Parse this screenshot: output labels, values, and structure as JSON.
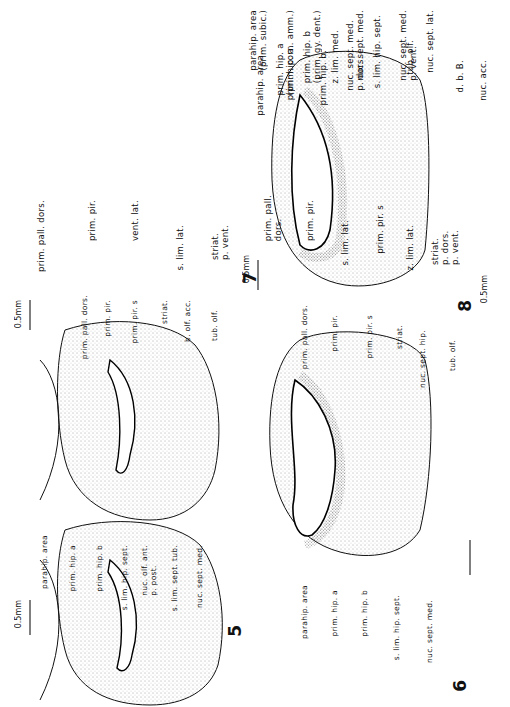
{
  "figure": {
    "panels": [
      {
        "id": "7",
        "number": "7",
        "scale": "0.5mm",
        "labels": [
          "parahip. area\n(prim. subic.)",
          "prim. hip. a\n(prim. corn. amm.)",
          "prim. hip. b\n(prim. gy. dent.)",
          "z. lim. med.",
          "nuc. sept. med.",
          "tub. olf.",
          "prim. pall. dors.",
          "prim. pir.",
          "vent. lat.",
          "s. lim. lat.",
          "striat.\np. vent."
        ]
      },
      {
        "id": "8",
        "number": "8",
        "scale": "0.5mm",
        "labels": [
          "parahip. area",
          "prim. hip. a.",
          "prim. hip. b.",
          "nuc. sept. med.\np. dors.",
          "s. lim. hip. sept.",
          "nuc. sept. med.\np. vent.",
          "nuc. sept. lat.",
          "d. b. B.",
          "nuc. acc.",
          "prim. pall.\ndors.",
          "prim. pir.",
          "s. lim. lat.",
          "prim. pir. s",
          "z. lim. lat.",
          "striat.\np. dors.\np. vent."
        ]
      },
      {
        "id": "5",
        "number": "5",
        "scale": "0.5mm",
        "labels": [
          "prim. pall. dors.",
          "prim. pir.",
          "prim. pir. s",
          "striat.",
          "b. olf. acc.",
          "tub. olf.",
          "parahip. area",
          "prim. hip. a",
          "prim. hip. b",
          "s. lim. hip. sept.",
          "nuc. olf. ant.\np. post.",
          "s. lim. sept. tub.",
          "nuc. sept. med."
        ]
      },
      {
        "id": "6",
        "number": "6",
        "scale": "0.5mm",
        "labels": [
          "prim. pall. dors.",
          "prim. pir.",
          "prim. pir. s",
          "striat.",
          "nuc. sept. hip.",
          "tub. olf.",
          "parahip. area",
          "prim. hip. a",
          "prim. hip. b",
          "s. lim. hip. sept.",
          "nuc. sept. med."
        ]
      }
    ]
  }
}
